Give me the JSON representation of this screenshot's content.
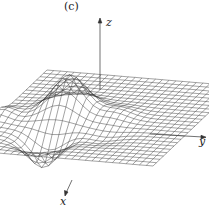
{
  "figure": {
    "panel_label": "(c)",
    "axes": {
      "x_label": "x",
      "y_label": "y",
      "z_label": "z"
    },
    "type": "3d-wireframe-surface",
    "colors": {
      "mesh": "#333333",
      "axis": "#333333",
      "background": "#ffffff"
    },
    "grid": {
      "nx": 24,
      "ny": 28
    }
  }
}
